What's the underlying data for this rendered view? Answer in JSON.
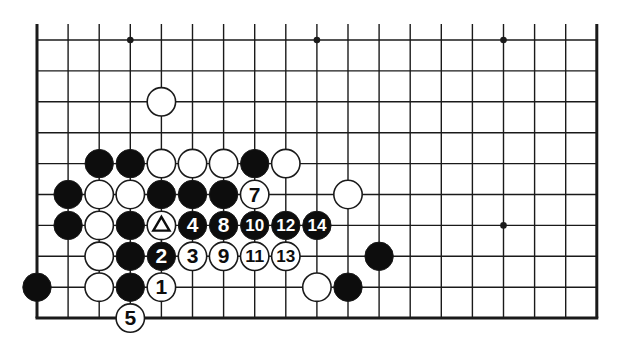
{
  "diagram": {
    "type": "go-board-partial",
    "grid": {
      "columns": 19,
      "rows": 10,
      "origin_x": 37,
      "origin_y": 40,
      "spacing_x": 31.1,
      "spacing_y": 30.9,
      "top_extension": 16,
      "edges": {
        "left": true,
        "right": true,
        "bottom": true,
        "top": false
      }
    },
    "hoshi": [
      {
        "col": 3,
        "row": 0
      },
      {
        "col": 9,
        "row": 0
      },
      {
        "col": 15,
        "row": 0
      },
      {
        "col": 15,
        "row": 6
      }
    ],
    "stones": [
      {
        "color": "white",
        "col": 4,
        "row": 2,
        "label": ""
      },
      {
        "color": "black",
        "col": 2,
        "row": 4,
        "label": ""
      },
      {
        "color": "black",
        "col": 3,
        "row": 4,
        "label": ""
      },
      {
        "color": "white",
        "col": 4,
        "row": 4,
        "label": ""
      },
      {
        "color": "white",
        "col": 5,
        "row": 4,
        "label": ""
      },
      {
        "color": "white",
        "col": 6,
        "row": 4,
        "label": ""
      },
      {
        "color": "black",
        "col": 7,
        "row": 4,
        "label": ""
      },
      {
        "color": "white",
        "col": 8,
        "row": 4,
        "label": ""
      },
      {
        "color": "black",
        "col": 1,
        "row": 5,
        "label": ""
      },
      {
        "color": "white",
        "col": 2,
        "row": 5,
        "label": ""
      },
      {
        "color": "white",
        "col": 3,
        "row": 5,
        "label": ""
      },
      {
        "color": "black",
        "col": 4,
        "row": 5,
        "label": ""
      },
      {
        "color": "black",
        "col": 5,
        "row": 5,
        "label": ""
      },
      {
        "color": "black",
        "col": 6,
        "row": 5,
        "label": ""
      },
      {
        "color": "white",
        "col": 7,
        "row": 5,
        "label": "7"
      },
      {
        "color": "white",
        "col": 10,
        "row": 5,
        "label": ""
      },
      {
        "color": "black",
        "col": 1,
        "row": 6,
        "label": ""
      },
      {
        "color": "white",
        "col": 2,
        "row": 6,
        "label": ""
      },
      {
        "color": "black",
        "col": 3,
        "row": 6,
        "label": ""
      },
      {
        "color": "white",
        "col": 4,
        "row": 6,
        "label": "",
        "marker": "triangle"
      },
      {
        "color": "black",
        "col": 5,
        "row": 6,
        "label": "4"
      },
      {
        "color": "black",
        "col": 6,
        "row": 6,
        "label": "8"
      },
      {
        "color": "black",
        "col": 7,
        "row": 6,
        "label": "10"
      },
      {
        "color": "black",
        "col": 8,
        "row": 6,
        "label": "12"
      },
      {
        "color": "black",
        "col": 9,
        "row": 6,
        "label": "14"
      },
      {
        "color": "white",
        "col": 2,
        "row": 7,
        "label": ""
      },
      {
        "color": "black",
        "col": 3,
        "row": 7,
        "label": ""
      },
      {
        "color": "black",
        "col": 4,
        "row": 7,
        "label": "2"
      },
      {
        "color": "white",
        "col": 5,
        "row": 7,
        "label": "3"
      },
      {
        "color": "white",
        "col": 6,
        "row": 7,
        "label": "9"
      },
      {
        "color": "white",
        "col": 7,
        "row": 7,
        "label": "11"
      },
      {
        "color": "white",
        "col": 8,
        "row": 7,
        "label": "13"
      },
      {
        "color": "black",
        "col": 11,
        "row": 7,
        "label": ""
      },
      {
        "color": "black",
        "col": 0,
        "row": 8,
        "label": ""
      },
      {
        "color": "white",
        "col": 2,
        "row": 8,
        "label": ""
      },
      {
        "color": "black",
        "col": 3,
        "row": 8,
        "label": ""
      },
      {
        "color": "white",
        "col": 4,
        "row": 8,
        "label": "1"
      },
      {
        "color": "white",
        "col": 9,
        "row": 8,
        "label": ""
      },
      {
        "color": "black",
        "col": 10,
        "row": 8,
        "label": ""
      },
      {
        "color": "white",
        "col": 3,
        "row": 9,
        "label": "5"
      }
    ],
    "colors": {
      "background": "#ffffff",
      "line": "#1a1a1a",
      "black_stone": "#0d0d0d",
      "white_stone": "#ffffff",
      "label_on_black": "#ffffff",
      "label_on_white": "#0d0d0d"
    }
  }
}
